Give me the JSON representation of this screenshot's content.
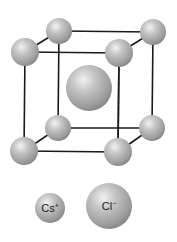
{
  "diagram": {
    "type": "crystal-unit-cell",
    "edge_color": "#1a1a1a",
    "sphere_color": "#a8a8a8",
    "corner_radius_back": 13,
    "corner_radius_front": 14,
    "center_radius": 23,
    "corners": {
      "back_top_left": {
        "x": 59,
        "y": 31
      },
      "back_top_right": {
        "x": 153,
        "y": 32
      },
      "front_top_left": {
        "x": 25,
        "y": 52
      },
      "front_top_right": {
        "x": 119,
        "y": 53
      },
      "back_bottom_left": {
        "x": 58,
        "y": 128
      },
      "back_bottom_right": {
        "x": 152,
        "y": 128
      },
      "front_bottom_left": {
        "x": 24,
        "y": 151
      },
      "front_bottom_right": {
        "x": 118,
        "y": 152
      }
    },
    "center": {
      "x": 89,
      "y": 88
    }
  },
  "legend": {
    "items": [
      {
        "label": "Cs",
        "charge": "+",
        "x": 50,
        "y": 208,
        "r": 15
      },
      {
        "label": "Cl",
        "charge": "−",
        "x": 109,
        "y": 206,
        "r": 23
      }
    ]
  }
}
